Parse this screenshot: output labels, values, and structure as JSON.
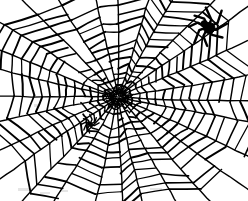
{
  "illustration": {
    "title": "Spider web with spiders",
    "subject": "orb-weaver spider web",
    "style": "black ink line drawing, hand-drawn",
    "background_color": "#ffffff",
    "ink_color": "#000000",
    "canvas": {
      "width": 248,
      "height": 201
    }
  },
  "web": {
    "name": "orb-web",
    "center": {
      "x": 118,
      "y": 97
    },
    "spoke_count": 28,
    "ring_count": 15,
    "radius_x": 132,
    "radius_y": 112,
    "inner_hub_radius": 5,
    "ring_fractions": [
      0.055,
      0.105,
      0.155,
      0.21,
      0.27,
      0.335,
      0.4,
      0.465,
      0.53,
      0.6,
      0.67,
      0.745,
      0.825,
      0.905,
      0.985
    ],
    "spoke_overshoot": 1.22,
    "stroke_width_rings": 1.5,
    "stroke_width_spokes": 1.4,
    "jitter_amount": 1.6,
    "ring_gap_probability": 0.14
  },
  "spiders": [
    {
      "name": "large-spider",
      "position": {
        "x": 208,
        "y": 27
      },
      "scale": 1.0,
      "leg_count": 8,
      "body_length": 11,
      "body_width": 8,
      "color": "#000000",
      "location_description": "upper right of web"
    },
    {
      "name": "small-spider",
      "position": {
        "x": 90,
        "y": 124
      },
      "scale": 0.45,
      "leg_count": 8,
      "body_length": 9,
      "body_width": 6,
      "color": "#000000",
      "location_description": "lower left of web center"
    }
  ],
  "smudges": [
    {
      "x": 18,
      "y": 188,
      "w": 14,
      "h": 3
    },
    {
      "x": 40,
      "y": 192,
      "w": 10,
      "h": 2
    },
    {
      "x": 60,
      "y": 190,
      "w": 8,
      "h": 2
    },
    {
      "x": 34,
      "y": 104,
      "w": 4,
      "h": 3
    },
    {
      "x": 150,
      "y": 188,
      "w": 12,
      "h": 2
    }
  ]
}
